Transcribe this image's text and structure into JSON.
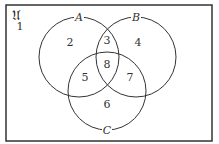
{
  "diagram": {
    "type": "venn",
    "universe_label": "𝔘",
    "sets": [
      {
        "name": "A",
        "label": "A",
        "cx": 79,
        "cy": 57,
        "r": 40,
        "label_x": 79,
        "label_y": 21
      },
      {
        "name": "B",
        "label": "B",
        "cx": 136,
        "cy": 57,
        "r": 40,
        "label_x": 136,
        "label_y": 21
      },
      {
        "name": "C",
        "label": "C",
        "cx": 107,
        "cy": 91,
        "r": 39,
        "label_x": 107,
        "label_y": 134
      }
    ],
    "regions": [
      {
        "id": "1",
        "label": "1",
        "x": 20,
        "y": 30,
        "description": "outside A, B, C"
      },
      {
        "id": "2",
        "label": "2",
        "x": 70,
        "y": 46,
        "description": "A only"
      },
      {
        "id": "3",
        "label": "3",
        "x": 107,
        "y": 44,
        "description": "A and B only"
      },
      {
        "id": "4",
        "label": "4",
        "x": 138,
        "y": 46,
        "description": "B only"
      },
      {
        "id": "8",
        "label": "8",
        "x": 107,
        "y": 68,
        "description": "A, B and C"
      },
      {
        "id": "5",
        "label": "5",
        "x": 85,
        "y": 81,
        "description": "A and C only"
      },
      {
        "id": "7",
        "label": "7",
        "x": 130,
        "y": 81,
        "description": "B and C only"
      },
      {
        "id": "6",
        "label": "6",
        "x": 107,
        "y": 108,
        "description": "C only"
      }
    ],
    "frame": {
      "x": 6,
      "y": 5,
      "width": 206,
      "height": 136
    }
  }
}
